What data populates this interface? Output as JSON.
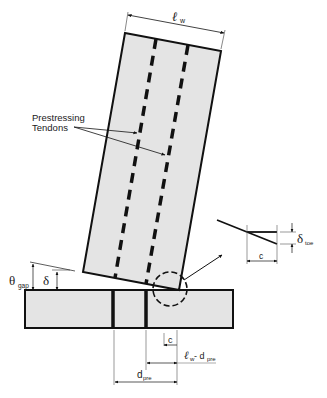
{
  "diagram": {
    "type": "structural-schematic",
    "colors": {
      "fill": "#e4e4e4",
      "stroke": "#111111",
      "background": "#ffffff"
    },
    "labels": {
      "wall_length": "ℓ",
      "wall_length_sub": "w",
      "tendons_line1": "Prestressing",
      "tendons_line2": "Tendons",
      "theta": "θ",
      "theta_sub": "gap",
      "delta": "δ",
      "delta_toe": "δ",
      "delta_toe_sub": "toe",
      "c_detail": "c",
      "c_base": "c",
      "lw_minus_dpre": "ℓ",
      "lw_minus_dpre_sub1": "w",
      "lw_minus_dpre_mid": "- d",
      "lw_minus_dpre_sub2": "pre",
      "dpre": "d",
      "dpre_sub": "pre"
    }
  }
}
